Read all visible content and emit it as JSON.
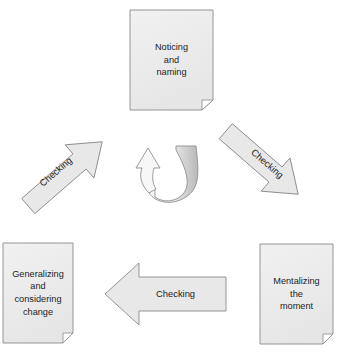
{
  "diagram": {
    "type": "cycle-flow-diagram",
    "background_color": "#ffffff",
    "shape_fill": "#e8e8e8",
    "shape_fill_light": "#f2f2f2",
    "shape_stroke": "#8a8a8a",
    "text_color": "#1c1c1c"
  },
  "nodes": [
    {
      "id": "noticing",
      "name": "node-noticing-and-naming",
      "shape": "document",
      "lines": [
        "Noticing",
        "and",
        "naming"
      ],
      "position": "top-center"
    },
    {
      "id": "mentalizing",
      "name": "node-mentalizing-the-moment",
      "shape": "document",
      "lines": [
        "Mentalizing",
        "the",
        "moment"
      ],
      "position": "bottom-right"
    },
    {
      "id": "generalizing",
      "name": "node-generalizing-and-considering-change",
      "shape": "document",
      "lines": [
        "Generalizing",
        "and",
        "considering",
        "change"
      ],
      "position": "bottom-left"
    }
  ],
  "arrows": [
    {
      "id": "arrow-right",
      "name": "arrow-checking-top-to-bottom-right",
      "label": "Checking",
      "direction": "down-right",
      "from": "noticing",
      "to": "mentalizing"
    },
    {
      "id": "arrow-bottom",
      "name": "arrow-checking-bottom-right-to-bottom-left",
      "label": "Checking",
      "direction": "left",
      "from": "mentalizing",
      "to": "generalizing"
    },
    {
      "id": "arrow-left",
      "name": "arrow-checking-bottom-left-to-top",
      "label": "Checking",
      "direction": "up-right",
      "from": "generalizing",
      "to": "noticing"
    },
    {
      "id": "arrow-center",
      "name": "arrow-center-u-turn",
      "label": "",
      "direction": "u-turn-up",
      "from": "",
      "to": ""
    }
  ]
}
